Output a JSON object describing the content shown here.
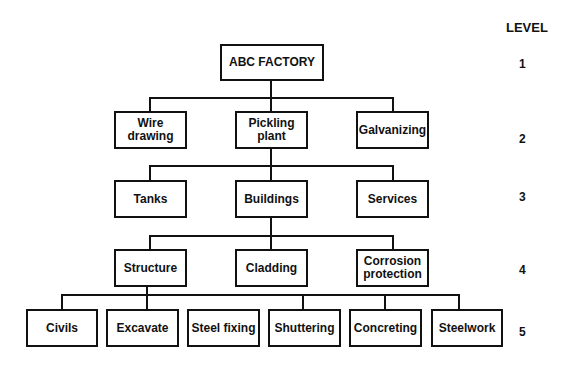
{
  "diagram": {
    "type": "work breakdown structure",
    "level_header": "LEVEL",
    "levels": [
      "1",
      "2",
      "3",
      "4",
      "5"
    ],
    "nodes": {
      "root": "ABC FACTORY",
      "level2": [
        "Wire drawing",
        "Pickling plant",
        "Galvanizing"
      ],
      "level3": [
        "Tanks",
        "Buildings",
        "Services"
      ],
      "level4": [
        "Structure",
        "Cladding",
        "Corrosion protection"
      ],
      "level5": [
        "Civils",
        "Excavate",
        "Steel fixing",
        "Shuttering",
        "Concreting",
        "Steelwork"
      ]
    },
    "labels": {
      "root": "ABC FACTORY",
      "wire1": "Wire",
      "wire2": "drawing",
      "pick1": "Pickling",
      "pick2": "plant",
      "galv": "Galvanizing",
      "tanks": "Tanks",
      "buildings": "Buildings",
      "services": "Services",
      "structure": "Structure",
      "cladding": "Cladding",
      "corr1": "Corrosion",
      "corr2": "protection",
      "civils": "Civils",
      "excavate": "Excavate",
      "steelfixing": "Steel fixing",
      "shuttering": "Shuttering",
      "concreting": "Concreting",
      "steelwork": "Steelwork"
    },
    "edges": [
      [
        "ABC FACTORY",
        "Wire drawing"
      ],
      [
        "ABC FACTORY",
        "Pickling plant"
      ],
      [
        "ABC FACTORY",
        "Galvanizing"
      ],
      [
        "Pickling plant",
        "Tanks"
      ],
      [
        "Pickling plant",
        "Buildings"
      ],
      [
        "Pickling plant",
        "Services"
      ],
      [
        "Buildings",
        "Structure"
      ],
      [
        "Buildings",
        "Cladding"
      ],
      [
        "Buildings",
        "Corrosion protection"
      ],
      [
        "Structure",
        "Civils"
      ],
      [
        "Structure",
        "Excavate"
      ],
      [
        "Structure",
        "Steel fixing"
      ],
      [
        "Structure",
        "Shuttering"
      ],
      [
        "Structure",
        "Concreting"
      ],
      [
        "Structure",
        "Steelwork"
      ]
    ]
  }
}
